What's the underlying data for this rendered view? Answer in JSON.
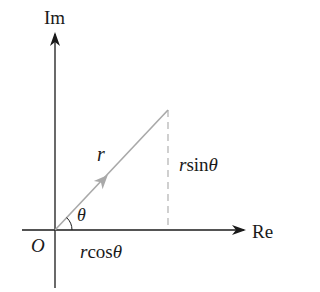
{
  "diagram": {
    "axes": {
      "vertical_label": "Im",
      "horizontal_label": "Re",
      "origin_label": "O"
    },
    "vector": {
      "label": "r",
      "color": "#a9a9a9"
    },
    "angle_label": "θ",
    "vertical_component": {
      "prefix": "r",
      "func": "sin",
      "var": "θ",
      "style": "dashed",
      "color": "#a9a9a9"
    },
    "horizontal_component": {
      "prefix": "r",
      "func": "cos",
      "var": "θ"
    },
    "colors": {
      "axis": "#1a1a1a",
      "vector": "#a9a9a9",
      "background": "#ffffff"
    }
  }
}
